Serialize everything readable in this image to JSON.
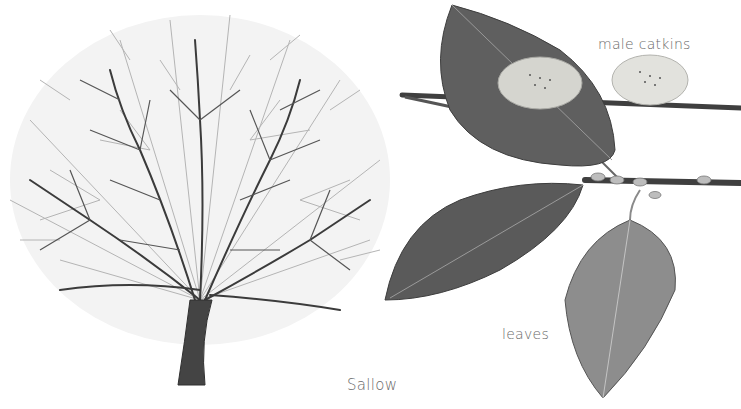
{
  "illustration": {
    "title": "Sallow",
    "labels": {
      "male_catkins": "male catkins",
      "leaves": "leaves"
    },
    "elements": [
      "tree-winter-silhouette",
      "branch-with-catkins",
      "leaf-upper",
      "leaf-left",
      "leaf-lower"
    ],
    "colors": {
      "background": "#ffffff",
      "branch": "#3a3a3a",
      "twig_light": "#9a9a9a",
      "leaf_dark": "#5e5e5e",
      "leaf_light": "#8c8c8c",
      "catkin": "#d9d9d4",
      "label_text": "#6a6a6a"
    }
  }
}
